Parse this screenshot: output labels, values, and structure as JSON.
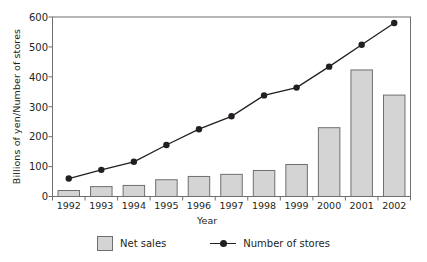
{
  "chart_data": {
    "type": "bar",
    "title": "",
    "xlabel": "Year",
    "ylabel": "Billions of yen/Number of stores",
    "categories": [
      "1992",
      "1993",
      "1994",
      "1995",
      "1996",
      "1997",
      "1998",
      "1999",
      "2000",
      "2001",
      "2002"
    ],
    "ylim": [
      0,
      600
    ],
    "yticks": [
      0,
      100,
      200,
      300,
      400,
      500,
      600
    ],
    "grid": false,
    "legend_position": "bottom",
    "series": [
      {
        "name": "Net sales",
        "type": "bar",
        "color": "#d4d4d4",
        "edge_color": "#6f6f6f",
        "values": [
          20,
          33,
          37,
          56,
          67,
          74,
          87,
          107,
          230,
          423,
          339
        ]
      },
      {
        "name": "Number of stores",
        "type": "line",
        "color": "#231f20",
        "marker": "circle",
        "values": [
          60,
          89,
          116,
          172,
          225,
          268,
          338,
          364,
          434,
          507,
          580
        ]
      }
    ]
  },
  "legend": {
    "items": [
      {
        "label": "Net sales",
        "marker": "square-swatch"
      },
      {
        "label": "Number of stores",
        "marker": "line-with-dot"
      }
    ]
  },
  "colors": {
    "bar_fill": "#d4d4d4",
    "bar_edge": "#6f6f6f",
    "line": "#231f20",
    "axis": "#6f6f6f",
    "text": "#231f20",
    "background": "#ffffff"
  }
}
